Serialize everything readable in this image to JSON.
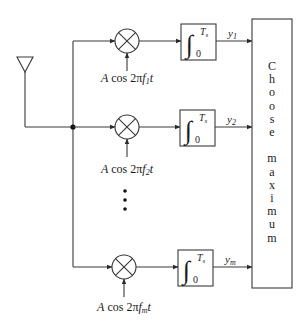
{
  "diagram": {
    "antenna": "antenna",
    "branches": [
      {
        "carrier_prefix": "A cos 2π",
        "freq_symbol": "f",
        "freq_sub": "1",
        "suffix": "t",
        "output_symbol": "y",
        "output_sub": "1",
        "integral_upper": "T",
        "integral_upper_sub": "s",
        "integral_lower": "0"
      },
      {
        "carrier_prefix": "A cos 2π",
        "freq_symbol": "f",
        "freq_sub": "2",
        "suffix": "t",
        "output_symbol": "y",
        "output_sub": "2",
        "integral_upper": "T",
        "integral_upper_sub": "s",
        "integral_lower": "0"
      },
      {
        "carrier_prefix": "A cos 2π",
        "freq_symbol": "f",
        "freq_sub": "m",
        "suffix": "t",
        "output_symbol": "y",
        "output_sub": "m",
        "integral_upper": "T",
        "integral_upper_sub": "s",
        "integral_lower": "0"
      }
    ],
    "ellipsis": "⋮",
    "decision_block": {
      "letters": [
        "C",
        "h",
        "o",
        "o",
        "s",
        "e",
        "",
        "m",
        "a",
        "x",
        "i",
        "m",
        "u",
        "m"
      ],
      "label": "Choose maximum"
    }
  }
}
